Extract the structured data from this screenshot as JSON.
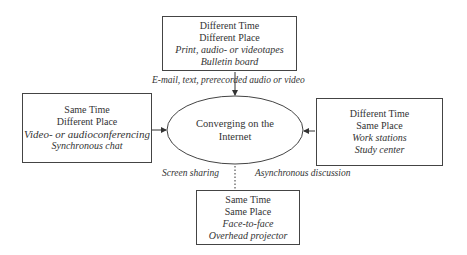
{
  "center": {
    "lines": [
      "Converging on the",
      "Internet"
    ]
  },
  "boxes": {
    "top": {
      "title": [
        "Different Time",
        "Different Place"
      ],
      "examples": [
        "Print, audio- or videotapes",
        "Bulletin board"
      ]
    },
    "left": {
      "title": [
        "Same Time",
        "Different Place"
      ],
      "examples": [
        "Video- or audioconferencing",
        "Synchronous chat"
      ]
    },
    "right": {
      "title": [
        "Different Time",
        "Same Place"
      ],
      "examples": [
        "Work stations",
        "Study center"
      ]
    },
    "bottom": {
      "title": [
        "Same Time",
        "Same Place"
      ],
      "examples": [
        "Face-to-face",
        "Overhead projector"
      ]
    }
  },
  "connector_labels": {
    "top": "E-mail, text, prerecorded audio or video",
    "bottom_left": "Screen sharing",
    "bottom_right": "Asynchronous discussion"
  },
  "colors": {
    "stroke": "#444444",
    "text": "#333333",
    "background": "#ffffff"
  }
}
